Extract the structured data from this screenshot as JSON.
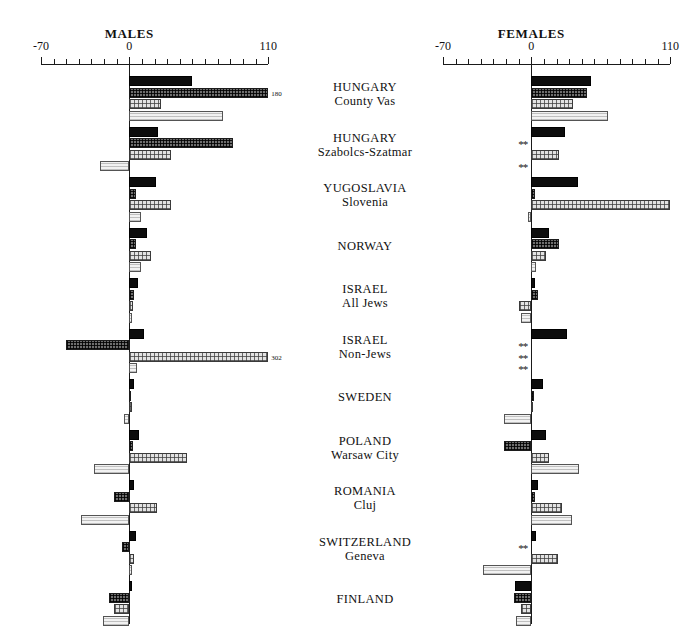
{
  "panels": [
    {
      "title": "MALES",
      "axis_min_label": "-70",
      "axis_zero_label": "0",
      "axis_max_label": "110"
    },
    {
      "title": "FEMALES",
      "axis_min_label": "-70",
      "axis_zero_label": "0",
      "axis_max_label": "110"
    }
  ],
  "groups": [
    {
      "line1": "HUNGARY",
      "line2": "County Vas"
    },
    {
      "line1": "HUNGARY",
      "line2": "Szabolcs-Szatmar"
    },
    {
      "line1": "YUGOSLAVIA",
      "line2": "Slovenia"
    },
    {
      "line1": "NORWAY",
      "line2": ""
    },
    {
      "line1": "ISRAEL",
      "line2": "All Jews"
    },
    {
      "line1": "ISRAEL",
      "line2": "Non-Jews"
    },
    {
      "line1": "SWEDEN",
      "line2": ""
    },
    {
      "line1": "POLAND",
      "line2": "Warsaw City"
    },
    {
      "line1": "ROMANIA",
      "line2": "Cluj"
    },
    {
      "line1": "SWITZERLAND",
      "line2": "Geneva"
    },
    {
      "line1": "FINLAND",
      "line2": ""
    }
  ],
  "chart_data": {
    "type": "bar",
    "orientation": "horizontal",
    "title": "",
    "xlabel": "",
    "ylabel": "",
    "xlim": [
      -70,
      110
    ],
    "tick_step": 10,
    "grid": false,
    "legend": "none",
    "categories": [
      "HUNGARY County Vas",
      "HUNGARY Szabolcs-Szatmar",
      "YUGOSLAVIA Slovenia",
      "NORWAY",
      "ISRAEL All Jews",
      "ISRAEL Non-Jews",
      "SWEDEN",
      "POLAND Warsaw City",
      "ROMANIA Cluj",
      "SWITZERLAND Geneva",
      "FINLAND"
    ],
    "panels": [
      {
        "name": "MALES",
        "series": [
          {
            "name": "series-1",
            "values": [
              50,
              23,
              21,
              14,
              7,
              12,
              4,
              8,
              4,
              5,
              2
            ]
          },
          {
            "name": "series-2",
            "values": [
              180,
              82,
              5,
              5,
              4,
              -50,
              1,
              3,
              -12,
              -6,
              -16
            ]
          },
          {
            "name": "series-3",
            "values": [
              25,
              33,
              33,
              17,
              3,
              302,
              2,
              46,
              22,
              4,
              -12
            ]
          },
          {
            "name": "series-4",
            "values": [
              74,
              -23,
              9,
              9,
              2,
              6,
              -4,
              -28,
              -38,
              2,
              -21
            ]
          }
        ],
        "clipped_labels": [
          {
            "group": 0,
            "series": 1,
            "text": "180"
          },
          {
            "group": 5,
            "series": 2,
            "text": "302"
          }
        ],
        "unavailable": []
      },
      {
        "name": "FEMALES",
        "series": [
          {
            "name": "series-1",
            "values": [
              47,
              27,
              37,
              14,
              3,
              28,
              9,
              12,
              5,
              4,
              -13
            ]
          },
          {
            "name": "series-2",
            "values": [
              44,
              null,
              3,
              22,
              5,
              null,
              2,
              -22,
              3,
              null,
              -14
            ]
          },
          {
            "name": "series-3",
            "values": [
              33,
              22,
              110,
              12,
              -10,
              null,
              1,
              14,
              24,
              21,
              -8
            ]
          },
          {
            "name": "series-4",
            "values": [
              61,
              null,
              -3,
              4,
              -8,
              null,
              -22,
              38,
              32,
              -38,
              -12
            ]
          }
        ],
        "clipped_labels": [],
        "unavailable": [
          {
            "group": 1,
            "series": 1,
            "marker": "**"
          },
          {
            "group": 1,
            "series": 3,
            "marker": "**"
          },
          {
            "group": 5,
            "series": 1,
            "marker": "**"
          },
          {
            "group": 5,
            "series": 2,
            "marker": "**"
          },
          {
            "group": 5,
            "series": 3,
            "marker": "**"
          },
          {
            "group": 9,
            "series": 1,
            "marker": "**"
          }
        ]
      }
    ]
  },
  "layout": {
    "panel_origins_x": [
      41,
      443
    ],
    "axis_px_per_unit": 1.262,
    "axis_y": 64,
    "group_top_y": 76,
    "group_pitch": 50.5,
    "bar_height": 10,
    "bar_gap": 1.5,
    "center_col_x": 295,
    "center_col_w": 140
  }
}
